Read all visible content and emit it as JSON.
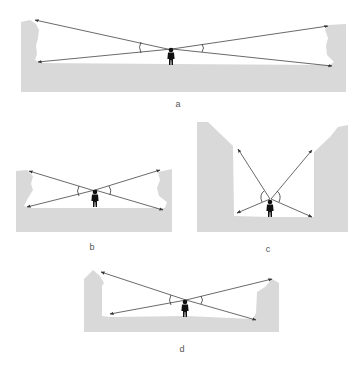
{
  "figure": {
    "colors": {
      "ground": "#d9d9d9",
      "lines": "#444444",
      "person": "#111111",
      "label": "#555555"
    },
    "panels": [
      {
        "id": "a",
        "label": "a",
        "scene": "wide space, low walls"
      },
      {
        "id": "b",
        "label": "b",
        "scene": "narrow space, low walls"
      },
      {
        "id": "c",
        "label": "c",
        "scene": "narrow space, tall walls"
      },
      {
        "id": "d",
        "label": "d",
        "scene": "medium space, medium walls"
      }
    ]
  }
}
